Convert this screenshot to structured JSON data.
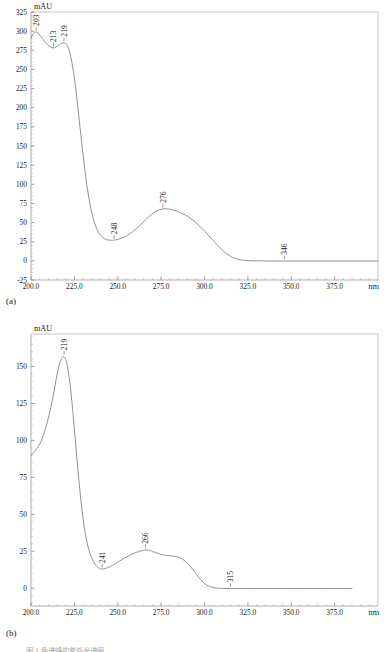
{
  "figure": {
    "panel_a_caption": "(a)",
    "panel_b_caption": "(b)",
    "bottom_caption": "图 1 色谱峰的紫外光谱图"
  },
  "chart_data": [
    {
      "id": "panel-a",
      "type": "line",
      "title": "",
      "xlabel": "nm",
      "ylabel": "mAU",
      "y_axis_title": "mAU",
      "x_axis_title": "nm",
      "xlim": [
        200,
        400
      ],
      "ylim": [
        -25,
        325
      ],
      "grid": false,
      "legend": "none",
      "x_ticks": [
        200.0,
        225.0,
        250.0,
        275.0,
        300.0,
        325.0,
        350.0,
        375.0
      ],
      "x_tick_labels": [
        "200.0",
        "225.0",
        "250.0",
        "275.0",
        "300.0",
        "325.0",
        "350.0",
        "375.0"
      ],
      "y_ticks": [
        -25,
        0,
        25,
        50,
        75,
        100,
        125,
        150,
        175,
        200,
        225,
        250,
        275,
        300,
        325
      ],
      "y_tick_labels": [
        "-25",
        "0",
        "25",
        "50",
        "75",
        "100",
        "125",
        "150",
        "175",
        "200",
        "225",
        "250",
        "275",
        "300",
        "325"
      ],
      "minor_ticks_per_major_x": 5,
      "minor_ticks_per_major_y": 5,
      "annotations": [
        {
          "label": "203",
          "x": 203,
          "y": 299
        },
        {
          "label": "213",
          "x": 213,
          "y": 278
        },
        {
          "label": "219",
          "x": 219,
          "y": 285
        },
        {
          "label": "248",
          "x": 248,
          "y": 27
        },
        {
          "label": "276",
          "x": 276,
          "y": 68
        },
        {
          "label": "346",
          "x": 346,
          "y": 0
        }
      ],
      "x": [
        200,
        201,
        202,
        203,
        204,
        205,
        206,
        207,
        208,
        209,
        210,
        211,
        212,
        213,
        214,
        215,
        216,
        217,
        218,
        219,
        220,
        221,
        222,
        223,
        224,
        225,
        226,
        227,
        228,
        229,
        230,
        231,
        232,
        233,
        234,
        235,
        236,
        237,
        238,
        239,
        240,
        241,
        242,
        243,
        244,
        245,
        246,
        247,
        248,
        250,
        252,
        254,
        256,
        258,
        260,
        262,
        264,
        266,
        268,
        270,
        272,
        274,
        276,
        278,
        280,
        282,
        284,
        286,
        288,
        290,
        292,
        294,
        296,
        298,
        300,
        302,
        304,
        306,
        308,
        310,
        312,
        314,
        316,
        318,
        320,
        322,
        324,
        326,
        330,
        335,
        340,
        346,
        350,
        360,
        370,
        380,
        390,
        400
      ],
      "y": [
        291,
        296,
        298.5,
        299,
        297.5,
        295,
        292,
        289,
        286,
        283.5,
        281,
        279.5,
        278.3,
        278,
        278.6,
        280,
        281.8,
        283.4,
        284.6,
        285,
        284,
        281,
        275,
        266,
        254,
        239,
        221,
        201,
        180,
        159,
        138,
        119,
        102,
        87,
        74,
        63,
        54,
        47,
        41.5,
        37,
        33.5,
        31,
        29.2,
        28,
        27.4,
        27,
        26.9,
        26.9,
        27,
        28,
        29.5,
        31.5,
        34,
        37,
        40.5,
        44.5,
        49,
        53.5,
        58,
        61.5,
        64.5,
        66.7,
        68,
        68.1,
        67.5,
        66.5,
        65,
        63,
        61,
        58.5,
        55.5,
        52,
        48,
        43.5,
        39,
        34,
        29,
        24,
        19,
        14.5,
        10.5,
        7.2,
        4.6,
        2.8,
        1.6,
        0.9,
        0.5,
        0.2,
        0,
        -0.1,
        -0.2,
        -0.2,
        -0.2,
        -0.2,
        -0.2,
        -0.2,
        -0.2,
        -0.2
      ]
    },
    {
      "id": "panel-b",
      "type": "line",
      "title": "",
      "xlabel": "nm",
      "ylabel": "mAU",
      "y_axis_title": "mAU",
      "x_axis_title": "nm",
      "xlim": [
        200,
        400
      ],
      "ylim": [
        -12,
        172
      ],
      "grid": false,
      "legend": "none",
      "x_ticks": [
        200.0,
        225.0,
        250.0,
        275.0,
        300.0,
        325.0,
        350.0,
        375.0
      ],
      "x_tick_labels": [
        "200.0",
        "225.0",
        "250.0",
        "275.0",
        "300.0",
        "325.0",
        "350.0",
        "375.0"
      ],
      "y_ticks": [
        0,
        25,
        50,
        75,
        100,
        125,
        150
      ],
      "y_tick_labels": [
        "0",
        "25",
        "50",
        "75",
        "100",
        "125",
        "150"
      ],
      "minor_ticks_per_major_x": 5,
      "minor_ticks_per_major_y": 5,
      "annotations": [
        {
          "label": "219",
          "x": 219,
          "y": 157
        },
        {
          "label": "241",
          "x": 241,
          "y": 13
        },
        {
          "label": "266",
          "x": 266,
          "y": 26
        },
        {
          "label": "315",
          "x": 315,
          "y": 0
        }
      ],
      "x": [
        200,
        201,
        202,
        203,
        204,
        205,
        206,
        207,
        208,
        209,
        210,
        211,
        212,
        213,
        214,
        215,
        216,
        217,
        218,
        219,
        220,
        221,
        222,
        223,
        224,
        225,
        226,
        227,
        228,
        229,
        230,
        231,
        232,
        233,
        234,
        235,
        236,
        237,
        238,
        239,
        240,
        241,
        242,
        244,
        246,
        248,
        250,
        252,
        254,
        256,
        258,
        260,
        262,
        264,
        266,
        268,
        270,
        272,
        274,
        276,
        278,
        280,
        282,
        284,
        286,
        288,
        290,
        292,
        294,
        296,
        298,
        300,
        302,
        304,
        306,
        308,
        310,
        315,
        320,
        330,
        340,
        350,
        360,
        370,
        380,
        390,
        400
      ],
      "y": [
        90,
        91,
        92.5,
        94,
        95.5,
        97.5,
        100,
        103,
        106.5,
        110.5,
        115,
        120,
        125.5,
        131.5,
        138,
        144.5,
        150,
        154,
        156.4,
        157,
        155,
        150.5,
        143,
        133,
        121,
        108,
        94,
        80.5,
        68,
        57,
        47,
        39,
        32.5,
        27.5,
        23.5,
        20.5,
        18,
        16.2,
        14.8,
        13.8,
        13.2,
        13,
        13.1,
        13.8,
        14.9,
        16.2,
        17.6,
        19.1,
        20.5,
        21.8,
        23,
        24,
        24.8,
        25.5,
        26,
        25.8,
        25,
        24,
        23.2,
        22.6,
        22.2,
        22,
        21.8,
        21.4,
        20.6,
        19.2,
        17.2,
        14.6,
        11.6,
        8.5,
        5.6,
        3.2,
        1.6,
        0.7,
        0.2,
        0,
        -0.1,
        -0.2,
        -0.2,
        -0.2,
        -0.2,
        -0.2,
        -0.2,
        -0.2,
        -0.2,
        -0.2
      ]
    }
  ]
}
